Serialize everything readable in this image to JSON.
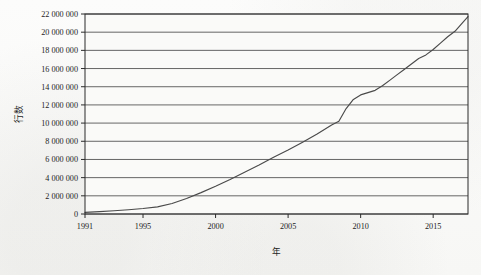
{
  "chart_data": {
    "type": "line",
    "title": "",
    "xlabel": "年",
    "ylabel": "行数",
    "xlim": [
      1991,
      2017.4
    ],
    "ylim": [
      0,
      22000000
    ],
    "grid": true,
    "grid_axis": "y",
    "legend": false,
    "legend_position": "none",
    "series_color": "#4a4a4a",
    "frame_color": "#2b2b2b",
    "gridline_color": "#555555",
    "plot_background": "#fafaf8",
    "y_ticks": [
      0,
      2000000,
      4000000,
      6000000,
      8000000,
      10000000,
      12000000,
      14000000,
      16000000,
      18000000,
      20000000,
      22000000
    ],
    "y_tick_labels": [
      "0",
      "2 000 000",
      "4 000 000",
      "6 000 000",
      "8 000 000",
      "10 000 000",
      "12 000 000",
      "14 000 000",
      "16 000 000",
      "18 000 000",
      "20 000 000",
      "22 000 000"
    ],
    "x_ticks": [
      1991,
      1995,
      2000,
      2005,
      2010,
      2015
    ],
    "x_tick_labels": [
      "1991",
      "1995",
      "2000",
      "2005",
      "2010",
      "2015"
    ],
    "series": [
      {
        "name": "行数",
        "x": [
          1991,
          1992,
          1993,
          1994,
          1995,
          1996,
          1997,
          1998,
          1999,
          2000,
          2001,
          2002,
          2003,
          2004,
          2005,
          2006,
          2007,
          2008,
          2008.5,
          2009,
          2009.5,
          2010,
          2010.5,
          2011,
          2011.5,
          2012,
          2012.5,
          2013,
          2013.5,
          2014,
          2014.5,
          2015,
          2015.5,
          2016,
          2016.5,
          2017,
          2017.4
        ],
        "values": [
          180000,
          260000,
          360000,
          470000,
          600000,
          780000,
          1150000,
          1700000,
          2350000,
          3050000,
          3800000,
          4600000,
          5400000,
          6250000,
          7050000,
          7900000,
          8800000,
          9800000,
          10200000,
          11600000,
          12600000,
          13100000,
          13350000,
          13600000,
          14100000,
          14700000,
          15300000,
          15900000,
          16500000,
          17100000,
          17500000,
          18100000,
          18800000,
          19500000,
          20100000,
          21000000,
          21700000
        ]
      }
    ]
  }
}
